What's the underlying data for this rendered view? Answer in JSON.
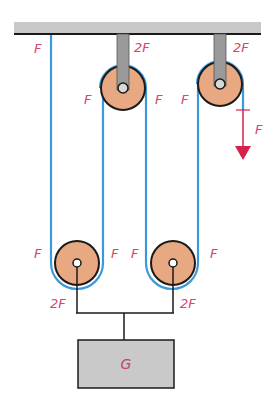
{
  "diagram": {
    "colors": {
      "rope": "#3a9ad9",
      "pulley_fill": "#e8a882",
      "pulley_stroke": "#1a1a1a",
      "bracket": "#9a9a9a",
      "ceiling": "#c8c8c8",
      "block": "#c9c9c9",
      "label": "#d6456a",
      "force_arrow": "#d6214a"
    },
    "labels": {
      "left_rope_top": "F",
      "upper_pulley_1_bracket": "2F",
      "upper_pulley_1_left": "F",
      "upper_pulley_1_right": "F",
      "upper_pulley_2_bracket": "2F",
      "upper_pulley_2_left": "F",
      "pull_force": "F",
      "lower_pulley_1_left": "F",
      "lower_pulley_1_right": "F",
      "lower_pulley_1_axle": "2F",
      "lower_pulley_2_left": "F",
      "lower_pulley_2_right": "F",
      "lower_pulley_2_axle": "2F",
      "weight": "G"
    }
  }
}
